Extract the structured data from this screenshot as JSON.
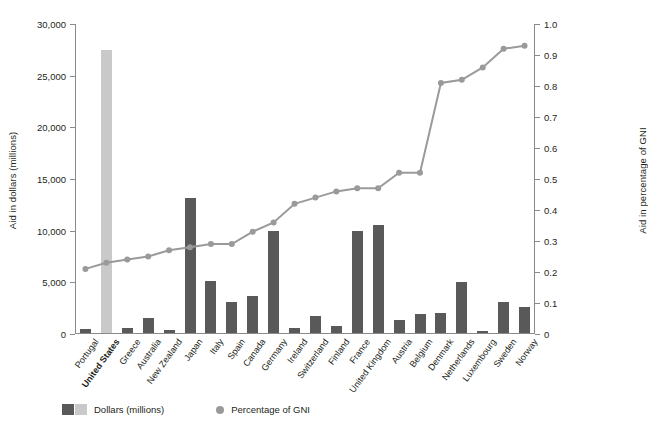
{
  "chart_data": {
    "type": "bar",
    "title": "",
    "subtitle": "",
    "xlabel": "",
    "ylabel": "Aid in dollars (millions)",
    "y2label": "Aid in percentage of GNI",
    "ylim": [
      0,
      30000
    ],
    "y2lim": [
      0,
      1.0
    ],
    "ytick_labels": [
      "0",
      "5,000",
      "10,000",
      "15,000",
      "20,000",
      "25,000",
      "30,000"
    ],
    "ytick_values": [
      0,
      5000,
      10000,
      15000,
      20000,
      25000,
      30000
    ],
    "y2tick_labels": [
      "0",
      "0.1",
      "0.2",
      "0.3",
      "0.4",
      "0.5",
      "0.6",
      "0.7",
      "0.8",
      "0.9",
      "1.0"
    ],
    "y2tick_values": [
      0,
      0.1,
      0.2,
      0.3,
      0.4,
      0.5,
      0.6,
      0.7,
      0.8,
      0.9,
      1.0
    ],
    "grid": false,
    "legend_position": "bottom-left",
    "categories": [
      "Portugal",
      "United States",
      "Greece",
      "Australia",
      "New Zealand",
      "Japan",
      "Italy",
      "Spain",
      "Canada",
      "Germany",
      "Ireland",
      "Switzerland",
      "Finland",
      "France",
      "United Kingdom",
      "Austria",
      "Belgium",
      "Denmark",
      "Netherlands",
      "Luxembourg",
      "Sweden",
      "Norway"
    ],
    "highlighted_category": "United States",
    "series": [
      {
        "name": "Dollars (millions)",
        "axis": "left",
        "type": "bar",
        "color": "#595959",
        "highlight_color": "#c9c9c9",
        "values": [
          400,
          27400,
          450,
          1500,
          250,
          13100,
          5000,
          3000,
          3600,
          9900,
          500,
          1600,
          650,
          9900,
          10450,
          1300,
          1800,
          1900,
          4900,
          230,
          3000,
          2550
        ]
      },
      {
        "name": "Percentage of GNI",
        "axis": "right",
        "type": "line",
        "color": "#9a9a9a",
        "values": [
          0.21,
          0.23,
          0.24,
          0.25,
          0.27,
          0.28,
          0.29,
          0.29,
          0.33,
          0.36,
          0.42,
          0.44,
          0.46,
          0.47,
          0.47,
          0.52,
          0.52,
          0.81,
          0.82,
          0.86,
          0.92,
          0.93
        ]
      }
    ]
  },
  "legend": {
    "dollars_label": "Dollars (millions)",
    "gni_label": "Percentage of GNI"
  }
}
